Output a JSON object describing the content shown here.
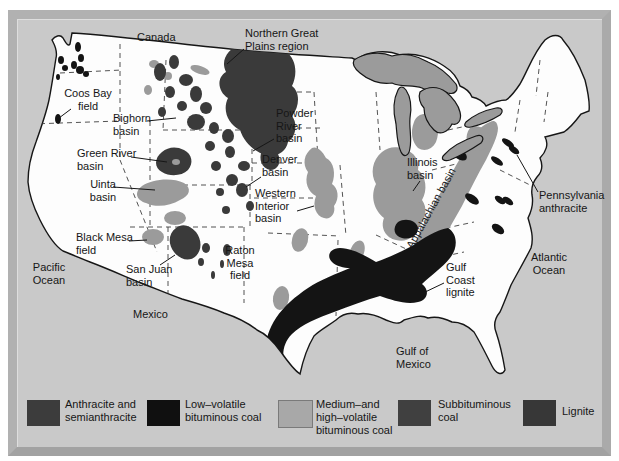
{
  "map_labels": {
    "canada": "Canada",
    "northern_great_plains": "Northern Great\nPlains region",
    "coos_bay": "Coos Bay\nfield",
    "bighorn": "Bighorn\nbasin",
    "powder_river": "Powder\nRiver\nbasin",
    "green_river": "Green River\nbasin",
    "denver": "Denver\nbasin",
    "uinta": "Uinta\nbasin",
    "western_interior": "Western\nInterior\nbasin",
    "illinois": "Illinois\nbasin",
    "appalachian": "Appalachian basin",
    "pennsylvania_anthracite": "Pennsylvania\nanthracite",
    "black_mesa": "Black Mesa\nfield",
    "pacific_ocean": "Pacific\nOcean",
    "san_juan": "San Juan\nbasin",
    "raton_mesa": "Raton\nMesa\nfield",
    "gulf_coast_lignite": "Gulf\nCoast\nlignite",
    "atlantic_ocean": "Atlantic\nOcean",
    "mexico": "Mexico",
    "gulf_of_mexico": "Gulf of\nMexico"
  },
  "legend": {
    "items": [
      {
        "label": "Anthracite and\nsemianthracite",
        "color": "#3c3c3c"
      },
      {
        "label": "Low–volatile\nbituminous coal",
        "color": "#101010"
      },
      {
        "label": "Medium–and\nhigh–volatile\nbituminous coal",
        "color": "#a8a8a8"
      },
      {
        "label": "Subbituminous\ncoal",
        "color": "#404040"
      },
      {
        "label": "Lignite",
        "color": "#373737"
      }
    ]
  },
  "colors": {
    "ocean_background": "#c9c9c9",
    "land": "#fdfdfd",
    "lakes": "#9b9b9b",
    "medium_gray_deposit": "#9b9b9b",
    "dark_gray_deposit": "#3a3a3a",
    "black_deposit": "#141414",
    "frame_border": "#b1b1b1"
  }
}
